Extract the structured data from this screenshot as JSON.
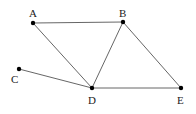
{
  "diagram": {
    "type": "graph",
    "nodes": [
      {
        "id": "A",
        "label": "A",
        "x": 33,
        "y": 23,
        "lx": 29,
        "ly": 17
      },
      {
        "id": "B",
        "label": "B",
        "x": 123,
        "y": 22,
        "lx": 119,
        "ly": 17
      },
      {
        "id": "C",
        "label": "C",
        "x": 19,
        "y": 69,
        "lx": 11,
        "ly": 83
      },
      {
        "id": "D",
        "label": "D",
        "x": 92,
        "y": 88,
        "lx": 88,
        "ly": 104
      },
      {
        "id": "E",
        "label": "E",
        "x": 181,
        "y": 88,
        "lx": 177,
        "ly": 104
      }
    ],
    "edges": [
      {
        "from": "A",
        "to": "B"
      },
      {
        "from": "A",
        "to": "D"
      },
      {
        "from": "B",
        "to": "D"
      },
      {
        "from": "B",
        "to": "E"
      },
      {
        "from": "C",
        "to": "D"
      },
      {
        "from": "D",
        "to": "E"
      }
    ],
    "colors": {
      "edge": "#555555",
      "node": "#000000",
      "label": "#222222"
    }
  }
}
